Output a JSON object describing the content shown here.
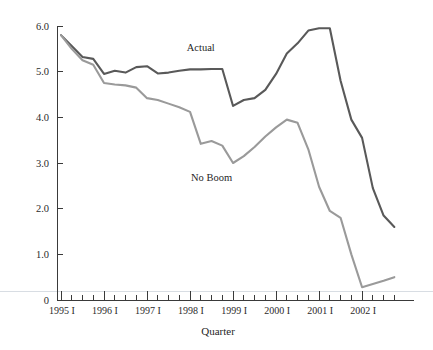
{
  "chart_data": {
    "type": "line",
    "title": "",
    "xlabel": "Quarter",
    "ylabel": "",
    "ylim": [
      0,
      6.0
    ],
    "grid": false,
    "legend_position": "inline-annotation",
    "y_ticks": [
      "0",
      "1.0",
      "2.0",
      "3.0",
      "4.0",
      "5.0",
      "6.0"
    ],
    "y_tick_values": [
      0,
      1.0,
      2.0,
      3.0,
      4.0,
      5.0,
      6.0
    ],
    "x_tick_labels": [
      "1995 I",
      "1996 I",
      "1997 I",
      "1998 I",
      "1999 I",
      "2000 I",
      "2001 I",
      "2002 I"
    ],
    "x_major_quarters": [
      0,
      4,
      8,
      12,
      16,
      20,
      24,
      28
    ],
    "x": [
      "1995 I",
      "1995 II",
      "1995 III",
      "1995 IV",
      "1996 I",
      "1996 II",
      "1996 III",
      "1996 IV",
      "1997 I",
      "1997 II",
      "1997 III",
      "1997 IV",
      "1998 I",
      "1998 II",
      "1998 III",
      "1998 IV",
      "1999 I",
      "1999 II",
      "1999 III",
      "1999 IV",
      "2000 I",
      "2000 II",
      "2000 III",
      "2000 IV",
      "2001 I",
      "2001 II",
      "2001 III",
      "2001 IV",
      "2002 I",
      "2002 II",
      "2002 III",
      "2002 IV"
    ],
    "series": [
      {
        "name": "Actual",
        "color": "#595959",
        "label_x_index": 13,
        "label_y_value": 5.45,
        "values": [
          5.8,
          5.56,
          5.32,
          5.28,
          4.95,
          5.02,
          4.98,
          5.1,
          5.12,
          4.96,
          4.98,
          5.02,
          5.05,
          5.05,
          5.06,
          5.06,
          4.25,
          4.38,
          4.42,
          4.6,
          4.95,
          5.4,
          5.62,
          5.9,
          5.95,
          5.95,
          4.8,
          3.95,
          3.55,
          2.45,
          1.85,
          1.6
        ]
      },
      {
        "name": "No Boom",
        "color": "#9a9a9a",
        "label_x_index": 14,
        "label_y_value": 2.6,
        "values": [
          5.8,
          5.5,
          5.25,
          5.15,
          4.75,
          4.72,
          4.7,
          4.65,
          4.42,
          4.38,
          4.3,
          4.22,
          4.12,
          3.42,
          3.48,
          3.38,
          3.0,
          3.15,
          3.35,
          3.58,
          3.78,
          3.95,
          3.88,
          3.3,
          2.48,
          1.95,
          1.8,
          1.0,
          0.28,
          0.35,
          0.42,
          0.5
        ]
      }
    ]
  },
  "annotations": {
    "actual_label": "Actual",
    "no_boom_label": "No Boom",
    "x_axis_title": "Quarter"
  }
}
